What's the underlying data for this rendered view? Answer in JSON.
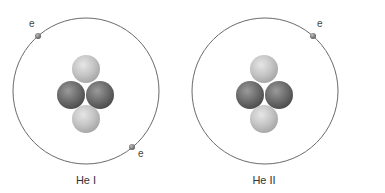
{
  "colors": {
    "orbit": "#6a6a6a",
    "proton_light": "#c8c8c8",
    "neutron_dark": "#6e6e6e",
    "electron": "#7a7a7a",
    "text": "#333333"
  },
  "atoms": [
    {
      "caption": "He I",
      "electron_count": 2,
      "electrons": [
        {
          "label": "e"
        },
        {
          "label": "e"
        }
      ],
      "nucleus": {
        "light_particles": 2,
        "dark_particles": 2
      }
    },
    {
      "caption": "He II",
      "electron_count": 1,
      "electrons": [
        {
          "label": "e"
        }
      ],
      "nucleus": {
        "light_particles": 2,
        "dark_particles": 2
      }
    }
  ]
}
